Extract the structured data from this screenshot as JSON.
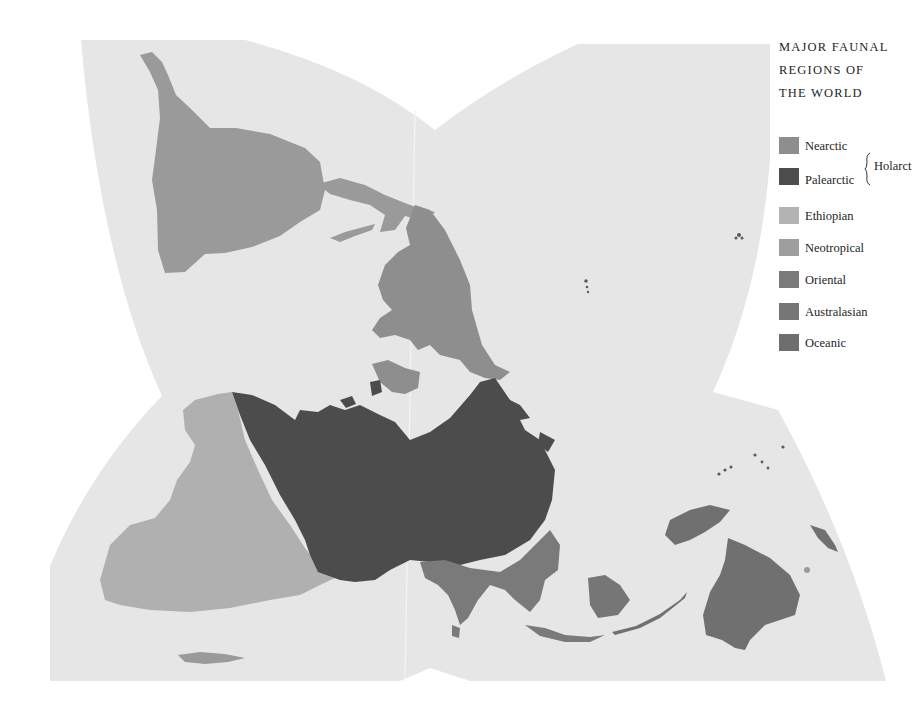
{
  "map": {
    "projection": "Dymaxion-style interrupted world map",
    "background_color": "#e6e6e6",
    "ocean_color": "#e6e6e6"
  },
  "legend": {
    "title_lines": [
      "MAJOR FAUNAL",
      "REGIONS OF",
      "THE WORLD"
    ],
    "items": [
      {
        "label": "Nearctic",
        "color": "#8e8e8e"
      },
      {
        "label": "Palearctic",
        "color": "#4d4d4d"
      },
      {
        "label": "Ethiopian",
        "color": "#b3b3b3"
      },
      {
        "label": "Neotropical",
        "color": "#9e9e9e"
      },
      {
        "label": "Oriental",
        "color": "#7a7a7a"
      },
      {
        "label": "Australasian",
        "color": "#767676"
      },
      {
        "label": "Oceanic",
        "color": "#6e6e6e"
      }
    ],
    "group": {
      "label": "Holarct",
      "members": [
        "Nearctic",
        "Palearctic"
      ]
    }
  }
}
